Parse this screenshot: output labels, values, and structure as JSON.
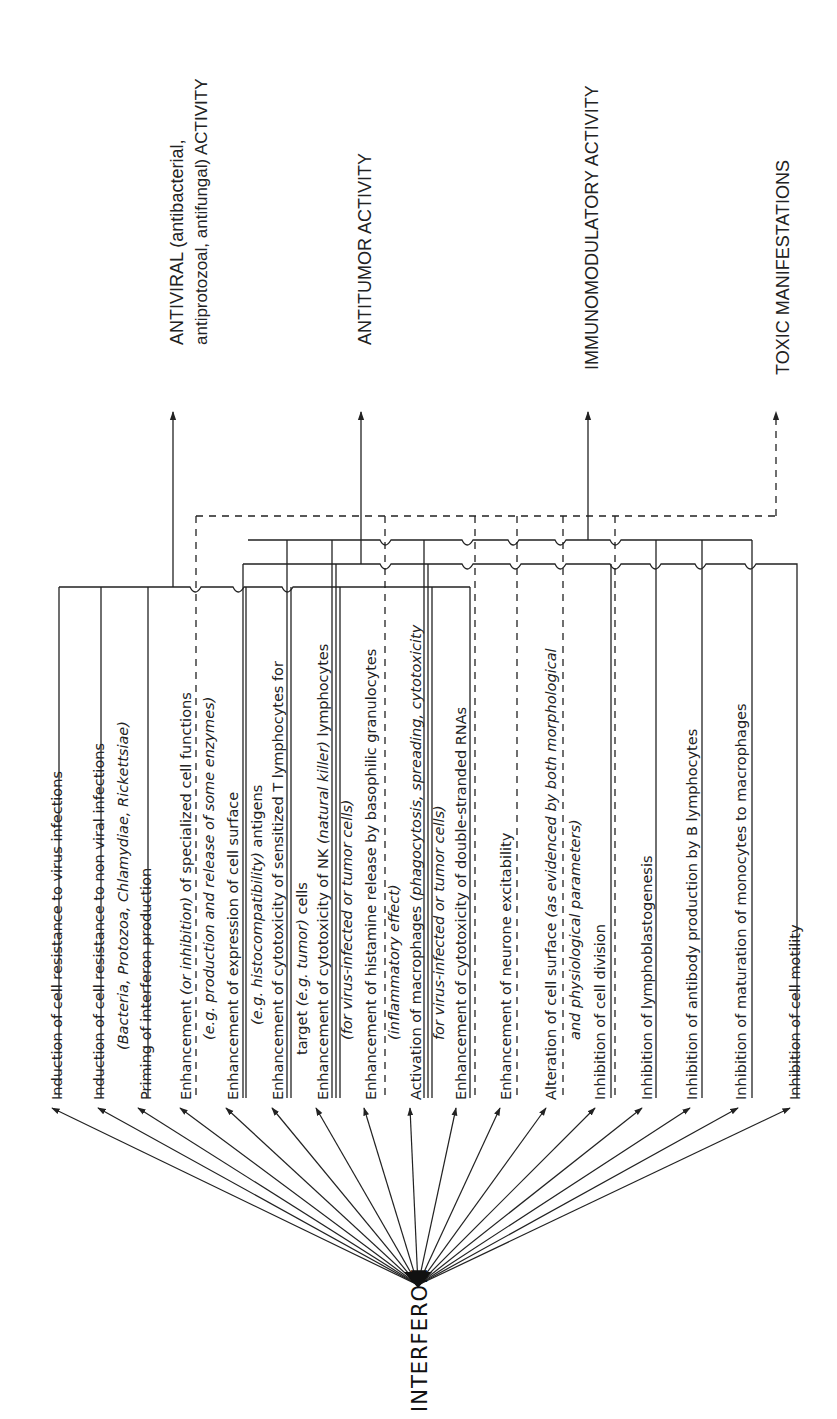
{
  "diagram": {
    "source": "INTERFERON",
    "categories": [
      {
        "id": "antiviral",
        "line1": "ANTIVIRAL (antibacterial,",
        "line2": "antiprotozoal, antifungal) ACTIVITY",
        "style": "solid"
      },
      {
        "id": "antitumor",
        "line1": "ANTITUMOR ACTIVITY",
        "style": "solid"
      },
      {
        "id": "immunomodulatory",
        "line1": "IMMUNOMODULATORY ACTIVITY",
        "style": "solid"
      },
      {
        "id": "toxic",
        "line1": "TOXIC MANIFESTATIONS",
        "style": "dashed"
      }
    ],
    "effects": [
      {
        "n": 1,
        "text": "Induction of cell resistance to virus infections"
      },
      {
        "n": 2,
        "text": "Induction of cell resistance to non viral infections",
        "sub": "(Bacteria, Protozoa, Chlamydiae, Rickettsiae)"
      },
      {
        "n": 3,
        "text": "Priming of interferon production"
      },
      {
        "n": 4,
        "text_a": "Enhancement ",
        "text_it": "(or inhibition)",
        "text_b": " of specialized cell functions",
        "sub": "(e.g. production and release of some enzymes)"
      },
      {
        "n": 5,
        "text": "Enhancement of expression of cell surface",
        "sub_it": "(e.g. histocompatibility)",
        "sub_b": " antigens"
      },
      {
        "n": 6,
        "text": "Enhancement of cytotoxicity of sensitized T lymphocytes for",
        "sub_a": "target ",
        "sub_it": "(e.g. tumor)",
        "sub_b": " cells"
      },
      {
        "n": 7,
        "text_a": "Enhancement of cytotoxicity of NK ",
        "text_it": "(natural killer)",
        "text_b": " lymphocytes",
        "sub": "(for virus-infected or tumor cells)"
      },
      {
        "n": 8,
        "text": "Enhancement of histamine release by basophilic granulocytes",
        "sub": "(inflammatory effect)"
      },
      {
        "n": 9,
        "text_a": "Activation of macrophages ",
        "text_it": "(phagocytosis, spreading, cytotoxicity",
        "sub": "for virus-infected or tumor cells)"
      },
      {
        "n": 10,
        "text": "Enhancement of cytotoxicity of double-stranded RNAs"
      },
      {
        "n": 11,
        "text": "Enhancement of neurone excitability"
      },
      {
        "n": 12,
        "text_a": "Alteration of cell surface ",
        "text_it": "(as evidenced by both morphological",
        "sub": "and physiological parameters)"
      },
      {
        "n": 13,
        "text": "Inhibition of cell division"
      },
      {
        "n": 14,
        "text": "Inhibition of lymphoblastogenesis"
      },
      {
        "n": 15,
        "text": "Inhibition of antibody production by B lymphocytes"
      },
      {
        "n": 16,
        "text": "Inhibition of maturation of monocytes to macrophages"
      },
      {
        "n": 17,
        "text": "Inhibition of cell motility"
      }
    ]
  }
}
